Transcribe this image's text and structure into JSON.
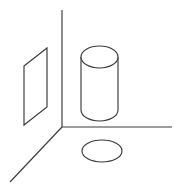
{
  "figure": {
    "title": "3D coordinate corner with rectangular plane, cylinder and ellipse",
    "background_color": "#ffffff",
    "stroke_color": "#3a3a3a",
    "stroke_width": 1.15,
    "canvas": {
      "width": 177,
      "height": 193
    }
  },
  "axes": {
    "origin": {
      "x": 62,
      "y": 127
    },
    "vertical": {
      "label": "vertical-axis",
      "x1": 62,
      "y1": 10,
      "x2": 62,
      "y2": 127
    },
    "horizontal": {
      "label": "horizontal-axis",
      "x1": 62,
      "y1": 127,
      "x2": 172,
      "y2": 127
    },
    "diagonal": {
      "label": "depth-axis",
      "x1": 62,
      "y1": 127,
      "x2": 10,
      "y2": 182
    }
  },
  "shapes": {
    "panel": {
      "label": "rectangular-panel",
      "points": "24,66 47,48 47,107 24,125"
    },
    "cylinder": {
      "label": "cylinder",
      "left_x": 81,
      "right_x": 118,
      "top_center_y": 57,
      "bottom_center_y": 110,
      "radius_x": 18.5,
      "radius_y": 11,
      "top_ellipse": {
        "cx": 99.5,
        "cy": 57,
        "rx": 18.5,
        "ry": 11
      },
      "side_left": {
        "x1": 81,
        "y1": 57,
        "x2": 81,
        "y2": 110
      },
      "side_right": {
        "x1": 118,
        "y1": 57,
        "x2": 118,
        "y2": 110
      },
      "bottom_arc": "M 81 110 A 18.5 11 0 0 0 118 110"
    },
    "floor_ellipse": {
      "label": "floor-ellipse",
      "cx": 102,
      "cy": 151,
      "rx": 20,
      "ry": 11
    }
  }
}
